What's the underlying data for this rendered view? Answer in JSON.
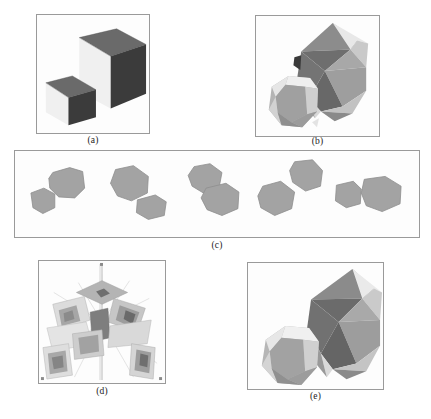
{
  "figure": {
    "type": "multi-panel-scientific-figure",
    "background_color": "#ffffff",
    "panel_border_color": "#9a9a9a",
    "panel_fill_color": "#fdfdfd",
    "caption_color": "#1b1b1b",
    "panel_count": 5
  },
  "captions": {
    "a": "(a)",
    "b": "(b)",
    "c": "(c)",
    "d": "(d)",
    "e": "(e)"
  },
  "panels": [
    {
      "id": "a",
      "label": "(a)",
      "content": "two shaded cubes on white background",
      "object_count": 2,
      "objects": [
        {
          "name": "large-cube",
          "shading": [
            "light-left-face",
            "dark-top-face",
            "dark-right-face"
          ]
        },
        {
          "name": "small-cube",
          "shading": [
            "light-left-face",
            "dark-top-face",
            "dark-right-face"
          ]
        }
      ],
      "bounds": {
        "x": 36,
        "y": 14,
        "w": 114,
        "h": 120
      }
    },
    {
      "id": "b",
      "label": "(b)",
      "content": "reconstructed faceted polyhedron and rounded polyhedron",
      "object_count": 3,
      "objects": [
        {
          "name": "faceted-polyhedron",
          "facets": "triangular gray facets"
        },
        {
          "name": "rounded-polyhedron",
          "facets": "smooth gray facets"
        },
        {
          "name": "small-dark-fragment",
          "facets": "dark sliver"
        }
      ],
      "bounds": {
        "x": 255,
        "y": 15,
        "w": 125,
        "h": 122
      }
    },
    {
      "id": "c",
      "label": "(c)",
      "content": "row of five pairs of gray silhouette blobs (input silhouettes)",
      "object_count": 10,
      "pair_count": 5,
      "bounds": {
        "x": 14,
        "y": 150,
        "w": 406,
        "h": 88
      }
    },
    {
      "id": "d",
      "label": "(d)",
      "content": "radial arrangement of camera view frustums around a vertical axis",
      "frustum_count": 8,
      "bounds": {
        "x": 38,
        "y": 260,
        "w": 128,
        "h": 124
      }
    },
    {
      "id": "e",
      "label": "(e)",
      "content": "reconstructed faceted polyhedron and rounded polyhedron, larger view",
      "object_count": 2,
      "objects": [
        {
          "name": "faceted-polyhedron",
          "facets": "triangular gray facets"
        },
        {
          "name": "rounded-polyhedron",
          "facets": "smooth gray facets"
        }
      ],
      "bounds": {
        "x": 247,
        "y": 262,
        "w": 137,
        "h": 128
      }
    }
  ],
  "palette": {
    "white_face": "#f2f2f2",
    "light_face": "#e4e4e4",
    "mid_light_face": "#c9c9c9",
    "mid_face": "#ababab",
    "mid_dark_face": "#8e8e8e",
    "dark_face": "#6d6d6d",
    "very_dark_face": "#3c3c3c",
    "blob_fill": "#a3a3a3",
    "blob_edge": "#8b8b8b",
    "frustum_light": "#dedede",
    "frustum_mid": "#bcbcbc",
    "frustum_dark": "#7d7d7d"
  }
}
